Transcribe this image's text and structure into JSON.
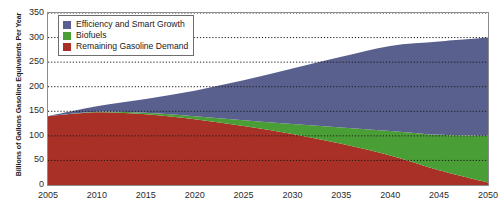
{
  "chart_data": {
    "type": "area",
    "stacked": true,
    "title": "",
    "xlabel": "",
    "ylabel": "Billions of Gallons Gasoline Equivalents Per Year",
    "xlim": [
      2005,
      2050
    ],
    "ylim": [
      0,
      350
    ],
    "grid": true,
    "grid_style": "dotted-horizontal",
    "legend_position": "upper-left",
    "x_ticks": [
      2005,
      2010,
      2015,
      2020,
      2025,
      2030,
      2035,
      2040,
      2045,
      2050
    ],
    "y_ticks": [
      0,
      50,
      100,
      150,
      200,
      250,
      300,
      350
    ],
    "x": [
      2005,
      2010,
      2015,
      2020,
      2025,
      2030,
      2035,
      2040,
      2045,
      2050
    ],
    "series": [
      {
        "name": "Remaining Gasoline Demand",
        "color": "#A83026",
        "values": [
          140,
          148,
          144,
          134,
          120,
          104,
          84,
          60,
          30,
          5
        ]
      },
      {
        "name": "Biofuels",
        "color": "#4A9E36",
        "values": [
          0,
          1,
          3,
          6,
          12,
          20,
          33,
          50,
          72,
          95
        ]
      },
      {
        "name": "Efficiency and Smart Growth",
        "color": "#5A608E",
        "values": [
          0,
          11,
          28,
          52,
          81,
          113,
          144,
          173,
          190,
          200
        ]
      }
    ],
    "totals": [
      140,
      160,
      175,
      192,
      213,
      237,
      261,
      283,
      292,
      300
    ]
  },
  "legend": {
    "items": [
      {
        "label": "Efficiency and Smart Growth",
        "color": "#5A608E"
      },
      {
        "label": "Biofuels",
        "color": "#4A9E36"
      },
      {
        "label": "Remaining Gasoline Demand",
        "color": "#A83026"
      }
    ]
  },
  "axes": {
    "y_title": "Billions of Gallons Gasoline Equivalents Per Year",
    "y_labels": [
      "350",
      "300",
      "250",
      "200",
      "150",
      "100",
      "50",
      "0"
    ],
    "x_labels": [
      "2005",
      "2010",
      "2015",
      "2020",
      "2025",
      "2030",
      "2035",
      "2040",
      "2045",
      "2050"
    ]
  }
}
